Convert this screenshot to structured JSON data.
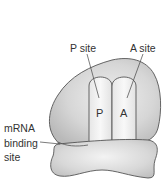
{
  "diagram": {
    "labels": {
      "p_site": "P site",
      "a_site": "A site",
      "mrna_line1": "mRNA",
      "mrna_line2": "binding",
      "mrna_line3": "site"
    },
    "site_letters": {
      "p": "P",
      "a": "A"
    },
    "colors": {
      "subunit_fill": "#c9c9c9",
      "subunit_highlight": "#ededed",
      "tunnel_fill": "#f2f2f2",
      "outline": "#555555",
      "text": "#333333",
      "background": "#ffffff"
    }
  }
}
